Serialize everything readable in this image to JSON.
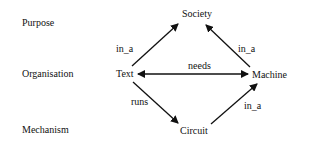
{
  "levels": [
    {
      "label": "Purpose"
    },
    {
      "label": "Organisation"
    },
    {
      "label": "Mechanism"
    }
  ],
  "nodes": {
    "society": "Society",
    "text": "Text",
    "machine": "Machine",
    "circuit": "Circuit"
  },
  "edges": [
    {
      "from": "Text",
      "to": "Society",
      "label": "in_a"
    },
    {
      "from": "Machine",
      "to": "Society",
      "label": "in_a"
    },
    {
      "from": "Text",
      "to": "Machine",
      "label": "needs",
      "bidirectional": true
    },
    {
      "from": "Text",
      "to": "Circuit",
      "label": "runs"
    },
    {
      "from": "Circuit",
      "to": "Machine",
      "label": "in_a"
    }
  ]
}
